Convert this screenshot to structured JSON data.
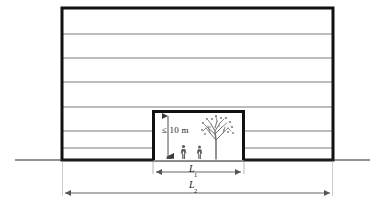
{
  "figure": {
    "type": "architectural-elevation-diagram",
    "title_caption": "",
    "labels": {
      "height_limit": "≤ 10 m",
      "l1_base": "L",
      "l1_sub": "1",
      "l2_base": "L",
      "l2_sub": "2"
    },
    "colors": {
      "outline": "#111111",
      "floor_line": "#7d7d7d",
      "ground_line": "#2b2b2b",
      "dimension_line": "#555555",
      "vegetation": "#6a6a6a",
      "background": "#ffffff"
    },
    "building": {
      "name": "building-elevation",
      "x": 62,
      "y": 8,
      "width": 271,
      "height": 152,
      "floor_count": 7,
      "floor_line_y": [
        34,
        58,
        82,
        107,
        131,
        148
      ]
    },
    "ground": {
      "name": "ground-line",
      "y": 160,
      "x_start": 15,
      "x_end": 370
    },
    "opening": {
      "name": "through-passage-opening",
      "x": 152,
      "y": 110,
      "width": 93,
      "height": 50
    },
    "height_dimension": {
      "name": "opening-height-dimension",
      "x": 168,
      "y_top": 113,
      "y_bottom": 159
    },
    "dimensions": [
      {
        "name": "l1-dimension",
        "label_base": "L",
        "label_sub": "1",
        "x_start": 152,
        "x_end": 245,
        "y": 172,
        "meaning": "opening width"
      },
      {
        "name": "l2-dimension",
        "label_base": "L",
        "label_sub": "2",
        "x_start": 62,
        "x_end": 333,
        "y": 193,
        "meaning": "building width"
      }
    ],
    "scene_elements": [
      {
        "name": "tree-silhouette",
        "x": 215,
        "y": 124
      },
      {
        "name": "person-figure-left",
        "x": 183,
        "y": 146
      },
      {
        "name": "person-figure-right",
        "x": 199,
        "y": 146
      },
      {
        "name": "small-object",
        "x": 169,
        "y": 155
      }
    ]
  }
}
